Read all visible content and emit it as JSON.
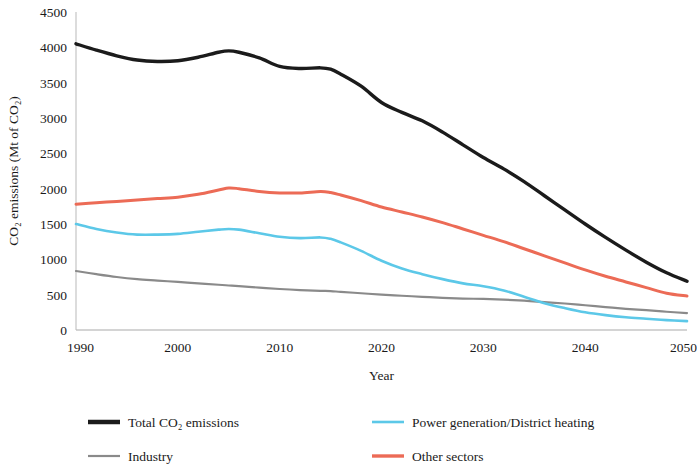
{
  "chart_data": {
    "type": "line",
    "title": "",
    "xlabel": "Year",
    "ylabel": "CO₂ emissions (Mt of CO₂)",
    "xlim": [
      1990,
      2050
    ],
    "ylim": [
      0,
      4500
    ],
    "ytick_step": 500,
    "xtick_step": 10,
    "grid": "horizontal-zero-only",
    "legend_position": "bottom",
    "xticks": [
      "1990",
      "2000",
      "2010",
      "2020",
      "2030",
      "2040",
      "2050"
    ],
    "yticks": [
      "0",
      "500",
      "1000",
      "1500",
      "2000",
      "2500",
      "3000",
      "3500",
      "4000",
      "4500"
    ],
    "x": [
      1990,
      1992,
      1994,
      1996,
      1998,
      2000,
      2002,
      2004,
      2005,
      2006,
      2008,
      2010,
      2012,
      2014,
      2015,
      2016,
      2018,
      2020,
      2022,
      2024,
      2026,
      2028,
      2030,
      2032,
      2034,
      2036,
      2038,
      2040,
      2042,
      2044,
      2046,
      2048,
      2050
    ],
    "series": [
      {
        "name": "Total CO₂ emissions",
        "color": "#1b1b1b",
        "width": 3.4,
        "values": [
          4050,
          3960,
          3880,
          3820,
          3800,
          3810,
          3860,
          3930,
          3950,
          3930,
          3850,
          3730,
          3700,
          3710,
          3690,
          3620,
          3450,
          3220,
          3080,
          2960,
          2800,
          2620,
          2440,
          2280,
          2100,
          1900,
          1700,
          1500,
          1310,
          1130,
          960,
          810,
          690
        ]
      },
      {
        "name": "Power generation/District heating",
        "color": "#5cc8e8",
        "width": 2.6,
        "values": [
          1500,
          1430,
          1380,
          1350,
          1350,
          1360,
          1390,
          1420,
          1430,
          1420,
          1370,
          1320,
          1300,
          1310,
          1290,
          1240,
          1120,
          980,
          870,
          790,
          720,
          660,
          620,
          560,
          470,
          380,
          310,
          250,
          210,
          180,
          160,
          140,
          125
        ]
      },
      {
        "name": "Industry",
        "color": "#8a8a8a",
        "width": 2.2,
        "values": [
          835,
          790,
          750,
          720,
          700,
          680,
          660,
          640,
          630,
          620,
          600,
          580,
          565,
          555,
          550,
          540,
          520,
          500,
          485,
          470,
          455,
          445,
          440,
          430,
          415,
          395,
          375,
          350,
          325,
          300,
          280,
          258,
          240
        ]
      },
      {
        "name": "Other sectors",
        "color": "#ec6b56",
        "width": 3.0,
        "values": [
          1780,
          1800,
          1820,
          1840,
          1860,
          1880,
          1920,
          1980,
          2010,
          2000,
          1960,
          1940,
          1940,
          1960,
          1945,
          1910,
          1830,
          1740,
          1670,
          1600,
          1520,
          1430,
          1340,
          1250,
          1150,
          1050,
          950,
          850,
          760,
          680,
          600,
          520,
          480
        ]
      }
    ],
    "legend": [
      {
        "label": "Total CO₂ emissions",
        "color": "#1b1b1b",
        "swatch_width": 4.5
      },
      {
        "label": "Power generation/District heating",
        "color": "#5cc8e8",
        "swatch_width": 2.6
      },
      {
        "label": "Industry",
        "color": "#8a8a8a",
        "swatch_width": 2.2
      },
      {
        "label": "Other sectors",
        "color": "#ec6b56",
        "swatch_width": 3.4
      }
    ]
  }
}
